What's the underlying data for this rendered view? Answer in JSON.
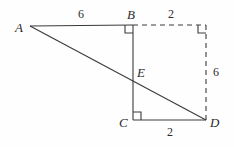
{
  "figure": {
    "type": "geometry-diagram",
    "width": 234,
    "height": 147,
    "background_color": "#fefefe",
    "stroke_color": "#3a3a3a",
    "text_color": "#2b2b2b",
    "vertices": [
      {
        "name": "A",
        "label": "A",
        "x": 30,
        "y": 26,
        "label_x": 15,
        "label_y": 21
      },
      {
        "name": "B",
        "label": "B",
        "x": 133,
        "y": 25,
        "label_x": 127,
        "label_y": 8
      },
      {
        "name": "E",
        "label": "E",
        "x": 133,
        "y": 78,
        "label_x": 137,
        "label_y": 66
      },
      {
        "name": "C",
        "label": "C",
        "x": 133,
        "y": 120,
        "label_x": 119,
        "label_y": 116
      },
      {
        "name": "D",
        "label": "D",
        "x": 206,
        "y": 120,
        "label_x": 210,
        "label_y": 116
      },
      {
        "name": "corner-top-right",
        "label": "",
        "x": 206,
        "y": 25,
        "label_x": 0,
        "label_y": 0
      }
    ],
    "solid_segments": [
      {
        "name": "segment-AB",
        "from": "A",
        "to": "B"
      },
      {
        "name": "segment-AD",
        "from": "A",
        "to": "D"
      },
      {
        "name": "segment-BC",
        "from": "B",
        "to": "C"
      },
      {
        "name": "segment-CD",
        "from": "C",
        "to": "D"
      }
    ],
    "dashed_segments": [
      {
        "name": "segment-B-topright",
        "from": "B",
        "to": "corner-top-right"
      },
      {
        "name": "segment-topright-D",
        "from": "corner-top-right",
        "to": "D"
      }
    ],
    "measure_labels": [
      {
        "name": "length-AB",
        "text": "6",
        "x": 78,
        "y": 8
      },
      {
        "name": "length-B-topright",
        "text": "2",
        "x": 168,
        "y": 8
      },
      {
        "name": "length-topright-D",
        "text": "6",
        "x": 213,
        "y": 66
      },
      {
        "name": "length-CD",
        "text": "2",
        "x": 167,
        "y": 126
      }
    ],
    "right_angle_marks": [
      {
        "name": "right-angle-at-B",
        "x": 133,
        "y": 25,
        "dx": -1,
        "dy": 1,
        "size": 8
      },
      {
        "name": "right-angle-at-C",
        "x": 133,
        "y": 120,
        "dx": 1,
        "dy": -1,
        "size": 8
      },
      {
        "name": "right-angle-at-top-right",
        "x": 206,
        "y": 25,
        "dx": -1,
        "dy": 1,
        "size": 8
      }
    ]
  }
}
